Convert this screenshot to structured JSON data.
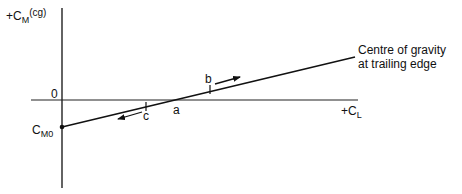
{
  "diagram": {
    "y_axis_label": {
      "prefix": "+C",
      "subscript": "M",
      "suffix": "(cg)"
    },
    "x_axis_label": {
      "prefix": "+C",
      "subscript": "L"
    },
    "origin_label": "0",
    "intercept_label": {
      "prefix": "C",
      "subscript": "M0"
    },
    "line_label_line1": "Centre of gravity",
    "line_label_line2": "at trailing edge",
    "point_a": "a",
    "point_b": "b",
    "point_c": "c",
    "colors": {
      "ink": "#111111",
      "background": "#ffffff"
    }
  }
}
